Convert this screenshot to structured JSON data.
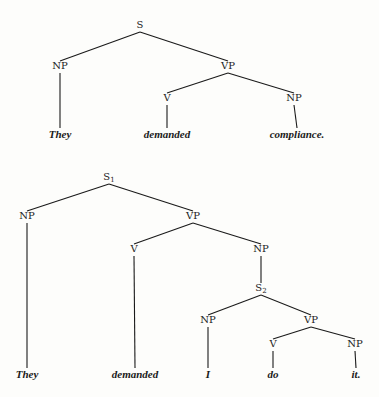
{
  "trees": [
    {
      "name": "tree-1",
      "nodes": [
        {
          "id": "S",
          "label": "S",
          "sub": "",
          "x": 140,
          "y": 28,
          "type": "node"
        },
        {
          "id": "NP1",
          "label": "NP",
          "sub": "",
          "x": 60,
          "y": 69,
          "type": "node"
        },
        {
          "id": "VP1",
          "label": "VP",
          "sub": "",
          "x": 228,
          "y": 69,
          "type": "node"
        },
        {
          "id": "V1",
          "label": "V",
          "sub": "",
          "x": 167,
          "y": 101,
          "type": "node"
        },
        {
          "id": "NP2",
          "label": "NP",
          "sub": "",
          "x": 294,
          "y": 101,
          "type": "node"
        },
        {
          "id": "L1",
          "label": "They",
          "sub": "",
          "x": 60,
          "y": 138,
          "type": "leaf"
        },
        {
          "id": "L2",
          "label": "demanded",
          "sub": "",
          "x": 167,
          "y": 138,
          "type": "leaf"
        },
        {
          "id": "L3",
          "label": "compliance.",
          "sub": "",
          "x": 297,
          "y": 138,
          "type": "leaf"
        }
      ],
      "edges": [
        [
          "S",
          "NP1"
        ],
        [
          "S",
          "VP1"
        ],
        [
          "NP1",
          "L1"
        ],
        [
          "VP1",
          "V1"
        ],
        [
          "VP1",
          "NP2"
        ],
        [
          "V1",
          "L2"
        ],
        [
          "NP2",
          "L3"
        ]
      ]
    },
    {
      "name": "tree-2",
      "nodes": [
        {
          "id": "S1",
          "label": "S",
          "sub": "1",
          "x": 109,
          "y": 180,
          "type": "node"
        },
        {
          "id": "NPa",
          "label": "NP",
          "sub": "",
          "x": 27,
          "y": 219,
          "type": "node"
        },
        {
          "id": "VPa",
          "label": "VP",
          "sub": "",
          "x": 193,
          "y": 219,
          "type": "node"
        },
        {
          "id": "Va",
          "label": "V",
          "sub": "",
          "x": 134,
          "y": 252,
          "type": "node"
        },
        {
          "id": "NPb",
          "label": "NP",
          "sub": "",
          "x": 261,
          "y": 252,
          "type": "node"
        },
        {
          "id": "S2",
          "label": "S",
          "sub": "2",
          "x": 261,
          "y": 291,
          "type": "node"
        },
        {
          "id": "NPc",
          "label": "NP",
          "sub": "",
          "x": 208,
          "y": 323,
          "type": "node"
        },
        {
          "id": "VPb",
          "label": "VP",
          "sub": "",
          "x": 311,
          "y": 323,
          "type": "node"
        },
        {
          "id": "Vb",
          "label": "V",
          "sub": "",
          "x": 273,
          "y": 347,
          "type": "node"
        },
        {
          "id": "NPd",
          "label": "NP",
          "sub": "",
          "x": 355,
          "y": 347,
          "type": "node"
        },
        {
          "id": "La",
          "label": "They",
          "sub": "",
          "x": 27,
          "y": 378,
          "type": "leaf"
        },
        {
          "id": "Lb",
          "label": "demanded",
          "sub": "",
          "x": 135,
          "y": 378,
          "type": "leaf"
        },
        {
          "id": "Lc",
          "label": "I",
          "sub": "",
          "x": 208,
          "y": 378,
          "type": "leaf"
        },
        {
          "id": "Ld",
          "label": "do",
          "sub": "",
          "x": 273,
          "y": 378,
          "type": "leaf"
        },
        {
          "id": "Le",
          "label": "it.",
          "sub": "",
          "x": 356,
          "y": 378,
          "type": "leaf"
        }
      ],
      "edges": [
        [
          "S1",
          "NPa"
        ],
        [
          "S1",
          "VPa"
        ],
        [
          "NPa",
          "La"
        ],
        [
          "VPa",
          "Va"
        ],
        [
          "VPa",
          "NPb"
        ],
        [
          "Va",
          "Lb"
        ],
        [
          "NPb",
          "S2"
        ],
        [
          "S2",
          "NPc"
        ],
        [
          "S2",
          "VPb"
        ],
        [
          "NPc",
          "Lc"
        ],
        [
          "VPb",
          "Vb"
        ],
        [
          "VPb",
          "NPd"
        ],
        [
          "Vb",
          "Ld"
        ],
        [
          "NPd",
          "Le"
        ]
      ]
    }
  ]
}
